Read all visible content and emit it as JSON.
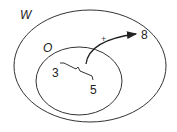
{
  "diagram": {
    "outer_set": {
      "label": "W"
    },
    "inner_set": {
      "label": "O"
    },
    "elements": [
      {
        "label": "3"
      },
      {
        "label": "5"
      },
      {
        "label": "8"
      }
    ],
    "arrow_sign": "+",
    "stroke_color": "#222222"
  }
}
